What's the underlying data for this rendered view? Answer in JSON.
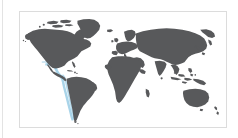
{
  "widget": {
    "type": "world-map-thumbnail",
    "name": "world-map-region-highlight"
  },
  "panel": {
    "border_color": "#dcdcdc",
    "background_color": "#ffffff"
  },
  "left_edge_rule": {
    "color": "#e3e3e3"
  },
  "map": {
    "projection": "equirectangular",
    "land_color": "#58595b",
    "ocean_color": "#ffffff",
    "highlight_color": "#a9d4e9",
    "highlight_region_name": "southeast-pacific-coast",
    "landmasses": [
      "north-america",
      "greenland",
      "arctic-archipelago",
      "central-america",
      "caribbean",
      "south-america",
      "europe",
      "british-isles",
      "scandinavia",
      "africa",
      "madagascar",
      "arabian-peninsula",
      "asia",
      "india",
      "sri-lanka",
      "japan",
      "southeast-asia",
      "indonesia",
      "philippines",
      "new-guinea",
      "australia",
      "tasmania",
      "new-zealand",
      "iceland"
    ],
    "labels": [],
    "legend": [],
    "tick_labels": []
  }
}
